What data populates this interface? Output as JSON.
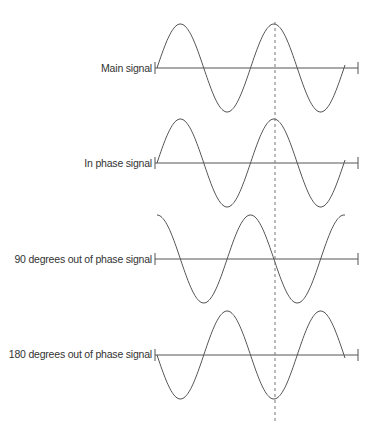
{
  "diagram": {
    "header_fragment": "…",
    "signals": [
      {
        "id": "main",
        "label": "Main signal",
        "phase_deg": 0
      },
      {
        "id": "in-phase",
        "label": "In phase signal",
        "phase_deg": 0
      },
      {
        "id": "90-out",
        "label": "90 degrees out of phase signal",
        "phase_deg": 90
      },
      {
        "id": "180-out",
        "label": "180 degrees out of phase signal",
        "phase_deg": 180
      }
    ],
    "cycles_shown": 2,
    "reference_line": "dashed vertical line at peak of second cycle of main signal",
    "colors": {
      "wave": "#555555",
      "axis": "#555555",
      "dashed": "#777777",
      "text": "#333333"
    }
  }
}
